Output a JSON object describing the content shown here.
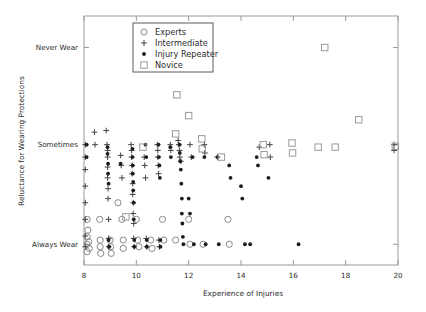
{
  "chart_data": {
    "type": "scatter",
    "title": "",
    "xlabel": "Experience of Injuries",
    "ylabel": "Reluctance for Wearing Protections",
    "xlim": [
      8,
      20
    ],
    "ylim": [
      0,
      3
    ],
    "xticks": [
      8,
      10,
      12,
      14,
      16,
      18,
      20
    ],
    "xticklabels": [
      "8",
      "10",
      "12",
      "14",
      "16",
      "18",
      "20"
    ],
    "yticks": [
      2.62,
      1.45,
      0.25
    ],
    "yticklabels": [
      "Never Wear",
      "Sometimes",
      "Always Wear"
    ],
    "grid": false,
    "legend_position": "top-left-inside",
    "series": [
      {
        "name": "Experts",
        "marker": "open-circle",
        "color": "#8a8a8a",
        "points": [
          [
            8.12,
            0.55
          ],
          [
            8.12,
            0.34
          ],
          [
            8.12,
            0.25
          ],
          [
            8.12,
            0.16
          ],
          [
            8.15,
            0.42
          ],
          [
            8.18,
            0.28
          ],
          [
            8.2,
            0.2
          ],
          [
            8.6,
            0.55
          ],
          [
            8.62,
            0.3
          ],
          [
            8.62,
            0.22
          ],
          [
            8.64,
            0.14
          ],
          [
            9.0,
            0.3
          ],
          [
            9.02,
            0.22
          ],
          [
            9.04,
            0.14
          ],
          [
            9.45,
            0.55
          ],
          [
            9.5,
            0.3
          ],
          [
            9.5,
            0.2
          ],
          [
            10.0,
            0.55
          ],
          [
            10.05,
            0.3
          ],
          [
            10.1,
            0.22
          ],
          [
            10.55,
            0.3
          ],
          [
            10.6,
            0.2
          ],
          [
            11.0,
            0.55
          ],
          [
            11.05,
            0.3
          ],
          [
            11.5,
            0.3
          ],
          [
            12.0,
            0.55
          ],
          [
            12.05,
            0.25
          ],
          [
            12.55,
            0.25
          ],
          [
            13.5,
            0.55
          ],
          [
            13.55,
            0.25
          ],
          [
            9.3,
            0.75
          ]
        ]
      },
      {
        "name": "Intermediate",
        "marker": "plus",
        "color": "#4a4a4a",
        "points": [
          [
            8.05,
            1.45
          ],
          [
            8.05,
            1.3
          ],
          [
            8.05,
            1.15
          ],
          [
            8.05,
            0.95
          ],
          [
            8.05,
            0.75
          ],
          [
            8.05,
            0.55
          ],
          [
            8.05,
            0.35
          ],
          [
            8.05,
            0.22
          ],
          [
            8.4,
            1.6
          ],
          [
            8.42,
            1.45
          ],
          [
            8.85,
            1.62
          ],
          [
            8.88,
            1.45
          ],
          [
            8.9,
            1.38
          ],
          [
            8.9,
            1.3
          ],
          [
            8.9,
            1.18
          ],
          [
            8.9,
            1.05
          ],
          [
            8.92,
            0.92
          ],
          [
            8.92,
            0.8
          ],
          [
            8.94,
            0.55
          ],
          [
            8.94,
            0.32
          ],
          [
            8.94,
            0.22
          ],
          [
            9.4,
            1.32
          ],
          [
            9.42,
            1.2
          ],
          [
            9.45,
            1.05
          ],
          [
            9.8,
            1.45
          ],
          [
            9.82,
            1.38
          ],
          [
            9.82,
            1.3
          ],
          [
            9.84,
            1.2
          ],
          [
            9.84,
            1.1
          ],
          [
            9.86,
            0.98
          ],
          [
            9.86,
            0.85
          ],
          [
            9.88,
            0.75
          ],
          [
            9.88,
            0.62
          ],
          [
            9.9,
            0.5
          ],
          [
            9.9,
            0.32
          ],
          [
            9.92,
            0.22
          ],
          [
            10.3,
            1.3
          ],
          [
            10.32,
            1.2
          ],
          [
            10.35,
            1.05
          ],
          [
            10.38,
            0.32
          ],
          [
            10.4,
            0.22
          ],
          [
            10.8,
            1.45
          ],
          [
            10.82,
            1.38
          ],
          [
            10.82,
            1.3
          ],
          [
            10.84,
            1.2
          ],
          [
            10.85,
            1.1
          ],
          [
            10.86,
            0.3
          ],
          [
            10.88,
            0.22
          ],
          [
            11.3,
            1.45
          ],
          [
            11.32,
            1.38
          ],
          [
            11.6,
            1.5
          ],
          [
            11.62,
            1.45
          ],
          [
            11.65,
            1.38
          ],
          [
            11.66,
            1.3
          ],
          [
            11.7,
            1.25
          ],
          [
            12.05,
            1.45
          ],
          [
            12.1,
            1.3
          ],
          [
            12.6,
            1.45
          ],
          [
            12.62,
            1.35
          ],
          [
            13.1,
            1.3
          ],
          [
            14.7,
            1.42
          ],
          [
            15.1,
            1.45
          ],
          [
            15.12,
            1.3
          ],
          [
            19.85,
            1.45
          ],
          [
            19.85,
            1.38
          ]
        ]
      },
      {
        "name": "Injury Repeater",
        "marker": "filled-dot",
        "color": "#1c1c1c",
        "points": [
          [
            8.1,
            1.45
          ],
          [
            8.1,
            1.3
          ],
          [
            8.9,
            1.42
          ],
          [
            8.9,
            1.34
          ],
          [
            8.92,
            1.22
          ],
          [
            8.92,
            1.1
          ],
          [
            8.94,
            0.98
          ],
          [
            8.94,
            0.3
          ],
          [
            8.96,
            0.22
          ],
          [
            9.4,
            1.22
          ],
          [
            9.85,
            1.4
          ],
          [
            9.85,
            1.3
          ],
          [
            9.86,
            1.2
          ],
          [
            9.86,
            1.1
          ],
          [
            9.88,
            1.0
          ],
          [
            9.88,
            0.9
          ],
          [
            9.9,
            0.75
          ],
          [
            9.9,
            0.55
          ],
          [
            9.92,
            0.3
          ],
          [
            9.92,
            0.22
          ],
          [
            10.35,
            1.45
          ],
          [
            10.38,
            1.3
          ],
          [
            10.4,
            0.3
          ],
          [
            10.4,
            0.22
          ],
          [
            10.85,
            1.45
          ],
          [
            10.86,
            1.3
          ],
          [
            10.88,
            1.2
          ],
          [
            10.9,
            1.05
          ],
          [
            10.92,
            0.3
          ],
          [
            10.92,
            0.22
          ],
          [
            11.3,
            1.42
          ],
          [
            11.32,
            1.3
          ],
          [
            11.65,
            1.45
          ],
          [
            11.66,
            1.35
          ],
          [
            11.68,
            1.25
          ],
          [
            11.7,
            1.15
          ],
          [
            11.72,
            0.98
          ],
          [
            11.74,
            0.8
          ],
          [
            11.74,
            0.62
          ],
          [
            11.76,
            0.5
          ],
          [
            11.78,
            0.34
          ],
          [
            11.8,
            0.25
          ],
          [
            12.15,
            1.3
          ],
          [
            12.2,
            0.25
          ],
          [
            12.6,
            1.3
          ],
          [
            12.65,
            0.25
          ],
          [
            13.1,
            1.3
          ],
          [
            13.15,
            0.25
          ],
          [
            13.55,
            1.2
          ],
          [
            14.0,
            0.95
          ],
          [
            14.05,
            0.8
          ],
          [
            14.15,
            0.25
          ],
          [
            14.35,
            0.25
          ],
          [
            14.6,
            1.3
          ],
          [
            14.65,
            1.2
          ],
          [
            15.05,
            1.05
          ],
          [
            16.2,
            0.25
          ],
          [
            12.0,
            0.8
          ],
          [
            12.05,
            0.62
          ],
          [
            13.6,
            1.05
          ]
        ]
      },
      {
        "name": "Novice",
        "marker": "open-square",
        "color": "#9a9a9a",
        "points": [
          [
            17.2,
            2.62
          ],
          [
            11.55,
            2.05
          ],
          [
            12.0,
            1.8
          ],
          [
            11.5,
            1.58
          ],
          [
            12.5,
            1.52
          ],
          [
            12.52,
            1.4
          ],
          [
            10.25,
            1.42
          ],
          [
            14.85,
            1.45
          ],
          [
            14.88,
            1.33
          ],
          [
            15.95,
            1.47
          ],
          [
            15.97,
            1.35
          ],
          [
            16.95,
            1.42
          ],
          [
            17.6,
            1.42
          ],
          [
            18.5,
            1.75
          ],
          [
            19.9,
            1.43
          ],
          [
            13.25,
            1.3
          ],
          [
            9.6,
            0.58
          ]
        ]
      }
    ]
  },
  "legend": {
    "items": [
      {
        "label": "Experts",
        "marker": "open-circle"
      },
      {
        "label": "Intermediate",
        "marker": "plus"
      },
      {
        "label": "Injury Repeater",
        "marker": "filled-dot"
      },
      {
        "label": "Novice",
        "marker": "open-square"
      }
    ]
  }
}
